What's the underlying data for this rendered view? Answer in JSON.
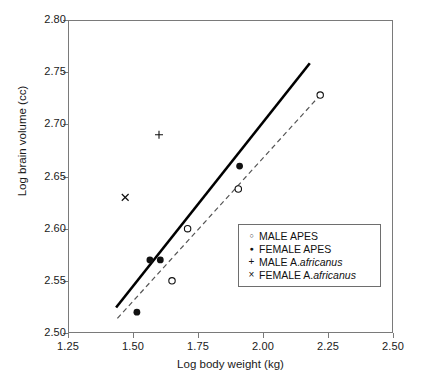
{
  "chart_data": {
    "type": "scatter",
    "title": "",
    "xlabel": "Log body weight (kg)",
    "ylabel": "Log brain volume (cc)",
    "xlim": [
      1.25,
      2.5
    ],
    "ylim": [
      2.5,
      2.8
    ],
    "xticks": [
      "1.25",
      "1.50",
      "1.75",
      "2.00",
      "2.25",
      "2.50"
    ],
    "yticks": [
      "2.50",
      "2.55",
      "2.60",
      "2.65",
      "2.70",
      "2.75",
      "2.80"
    ],
    "xtick_values": [
      1.25,
      1.5,
      1.75,
      2.0,
      2.25,
      2.5
    ],
    "ytick_values": [
      2.5,
      2.55,
      2.6,
      2.65,
      2.7,
      2.75,
      2.8
    ],
    "grid": false,
    "legend_position": "center-right",
    "series": [
      {
        "name": "MALE APES",
        "marker": "open-circle",
        "color": "#111111",
        "points": [
          {
            "x": 1.65,
            "y": 2.55
          },
          {
            "x": 1.71,
            "y": 2.6
          },
          {
            "x": 1.905,
            "y": 2.638
          },
          {
            "x": 2.22,
            "y": 2.728
          }
        ]
      },
      {
        "name": "FEMALE APES",
        "marker": "filled-circle",
        "color": "#111111",
        "points": [
          {
            "x": 1.515,
            "y": 2.52
          },
          {
            "x": 1.565,
            "y": 2.57
          },
          {
            "x": 1.605,
            "y": 2.57
          },
          {
            "x": 1.91,
            "y": 2.66
          }
        ]
      },
      {
        "name": "MALE A. africanus",
        "marker": "plus",
        "color": "#111111",
        "points": [
          {
            "x": 1.6,
            "y": 2.69
          }
        ]
      },
      {
        "name": "FEMALE A. africanus",
        "marker": "cross",
        "color": "#111111",
        "points": [
          {
            "x": 1.47,
            "y": 2.63
          }
        ]
      }
    ],
    "trend_lines": [
      {
        "name": "female-apes-regression",
        "style": "solid",
        "color": "#000000",
        "x1": 1.435,
        "y1": 2.5245,
        "x2": 2.18,
        "y2": 2.7585
      },
      {
        "name": "male-apes-regression",
        "style": "dashed",
        "color": "#555555",
        "x1": 1.44,
        "y1": 2.514,
        "x2": 2.218,
        "y2": 2.7275
      }
    ]
  },
  "legend": {
    "items": [
      {
        "marker": "open-circle",
        "label": "MALE APES",
        "species": "",
        "marker_name": "legend-marker-open-circle"
      },
      {
        "marker": "filled-circle",
        "label": "FEMALE APES",
        "species": "",
        "marker_name": "legend-marker-filled-circle"
      },
      {
        "marker": "plus",
        "label": "MALE A.",
        "species": "africanus",
        "marker_name": "legend-marker-plus"
      },
      {
        "marker": "cross",
        "label": "FEMALE A.",
        "species": "africanus",
        "marker_name": "legend-marker-cross"
      }
    ],
    "glyphs": {
      "open_circle": "○",
      "filled_circle": "●",
      "plus": "+",
      "cross": "×"
    }
  },
  "margin_notes": {
    "fragments": [
      "",
      "",
      ""
    ]
  },
  "colors": {
    "frame": "#7a7a7a",
    "solid_line": "#000000",
    "dashed_line": "#555555",
    "marker": "#111111",
    "text": "#1a1a1a",
    "background": "#ffffff"
  }
}
